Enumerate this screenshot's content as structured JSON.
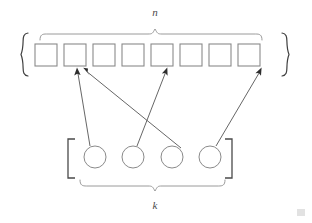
{
  "diagram": {
    "colors": {
      "background": "#ffffff",
      "square_stroke": "#8a8a8a",
      "circle_stroke": "#8a8a8a",
      "brace_stroke": "#8f8f8f",
      "bracket_stroke": "#4a4a4a",
      "curly_stroke": "#3f3f3f",
      "arrow_stroke": "#555555",
      "arrow_head": "#2e2e2e",
      "label_color": "#4a4a4a"
    },
    "top_group": {
      "label": "n",
      "label_x": 155,
      "label_y": 15,
      "container_open": "{",
      "container_close": "}",
      "item_count": 8,
      "item_shape": "square",
      "items": [
        {
          "index": 1,
          "x": 35,
          "y": 44,
          "w": 22,
          "h": 22
        },
        {
          "index": 2,
          "x": 64,
          "y": 44,
          "w": 22,
          "h": 22
        },
        {
          "index": 3,
          "x": 93,
          "y": 44,
          "w": 22,
          "h": 22
        },
        {
          "index": 4,
          "x": 122,
          "y": 44,
          "w": 22,
          "h": 22
        },
        {
          "index": 5,
          "x": 151,
          "y": 44,
          "w": 22,
          "h": 22
        },
        {
          "index": 6,
          "x": 180,
          "y": 44,
          "w": 22,
          "h": 22
        },
        {
          "index": 7,
          "x": 209,
          "y": 44,
          "w": 22,
          "h": 22
        },
        {
          "index": 8,
          "x": 238,
          "y": 44,
          "w": 22,
          "h": 22
        }
      ],
      "brace": {
        "x_start": 40,
        "x_end": 262,
        "y_base": 40,
        "y_tip": 29
      },
      "curly_left": {
        "x": 22,
        "y_top": 33,
        "y_bottom": 76
      },
      "curly_right": {
        "x": 288,
        "y_top": 33,
        "y_bottom": 76
      }
    },
    "bottom_group": {
      "label": "k",
      "label_x": 155,
      "label_y": 207,
      "container_open": "[",
      "container_close": "]",
      "item_count": 4,
      "item_shape": "circle",
      "items": [
        {
          "index": 1,
          "cx": 95,
          "cy": 157,
          "r": 11
        },
        {
          "index": 2,
          "cx": 133,
          "cy": 157,
          "r": 11
        },
        {
          "index": 3,
          "cx": 172,
          "cy": 157,
          "r": 11
        },
        {
          "index": 4,
          "cx": 210,
          "cy": 157,
          "r": 11
        }
      ],
      "brace": {
        "x_start": 80,
        "x_end": 225,
        "y_base": 180,
        "y_tip": 191
      },
      "bracket_left": {
        "x": 68,
        "y_top": 139,
        "y_bottom": 178,
        "arm": 7
      },
      "bracket_right": {
        "x": 232,
        "y_top": 139,
        "y_bottom": 178,
        "arm": 7
      }
    },
    "arrows": [
      {
        "name": "arrow-circle1-to-square2",
        "from_item": 1,
        "to_item": 2,
        "x1": 90,
        "y1": 146,
        "x2": 77,
        "y2": 69
      },
      {
        "name": "arrow-circle2-to-square5",
        "from_item": 2,
        "to_item": 5,
        "x1": 137,
        "y1": 146,
        "x2": 167,
        "y2": 69
      },
      {
        "name": "arrow-circle3-to-square2",
        "from_item": 3,
        "to_item": 2,
        "x1": 180,
        "y1": 148,
        "x2": 83,
        "y2": 69
      },
      {
        "name": "arrow-circle4-to-square8",
        "from_item": 4,
        "to_item": 8,
        "x1": 216,
        "y1": 146,
        "x2": 261,
        "y2": 69
      }
    ]
  }
}
